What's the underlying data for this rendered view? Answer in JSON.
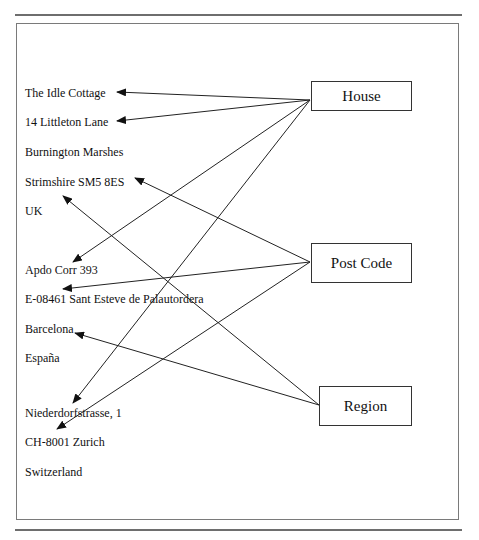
{
  "diagram": {
    "addresses": [
      {
        "text": "The Idle Cottage",
        "top": 86
      },
      {
        "text": "14 Littleton Lane",
        "top": 115
      },
      {
        "text": "Burnington Marshes",
        "top": 145
      },
      {
        "text": "Strimshire SM5 8ES",
        "top": 175
      },
      {
        "text": "UK",
        "top": 204
      },
      {
        "text": "Apdo Corr 393",
        "top": 263
      },
      {
        "text": "E-08461 Sant Esteve de Palautordera",
        "top": 292
      },
      {
        "text": "Barcelona",
        "top": 322
      },
      {
        "text": "España",
        "top": 351
      },
      {
        "text": "Niederdorfstrasse, 1",
        "top": 406
      },
      {
        "text": "CH-8001 Zurich",
        "top": 435
      },
      {
        "text": "Switzerland",
        "top": 465
      }
    ],
    "labels": {
      "house": "House",
      "post_code": "Post Code",
      "region": "Region"
    },
    "links": [
      {
        "from": "House",
        "to": "The Idle Cottage"
      },
      {
        "from": "House",
        "to": "14 Littleton Lane"
      },
      {
        "from": "House",
        "to": "Apdo Corr 393"
      },
      {
        "from": "House",
        "to": "Niederdorfstrasse, 1"
      },
      {
        "from": "Post Code",
        "to": "Strimshire SM5 8ES"
      },
      {
        "from": "Post Code",
        "to": "E-08461 Sant Esteve de Palautordera"
      },
      {
        "from": "Post Code",
        "to": "CH-8001 Zurich"
      },
      {
        "from": "Region",
        "to": "UK"
      },
      {
        "from": "Region",
        "to": "Barcelona"
      }
    ],
    "colors": {
      "line": "#222222",
      "rule": "#6e6e6e",
      "frame": "#7a7a7a"
    }
  }
}
